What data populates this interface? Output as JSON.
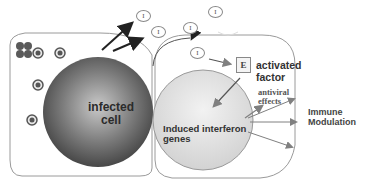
{
  "diagram": {
    "type": "biological-pathway",
    "left_cell": {
      "label_line1": "infected",
      "label_line2": "cell",
      "virus_particles_count": 4,
      "blocked_marker": "x-mark"
    },
    "right_cell": {
      "nucleus_label_line1": "Induced interferon",
      "nucleus_label_line2": "genes"
    },
    "interferon_symbol": "I",
    "interferon_molecules": [
      {
        "id": "i1",
        "x": 141,
        "y": 10
      },
      {
        "id": "i2",
        "x": 155,
        "y": 25
      },
      {
        "id": "i3",
        "x": 208,
        "y": 8
      },
      {
        "id": "i4",
        "x": 187,
        "y": 24
      },
      {
        "id": "i5",
        "x": 193,
        "y": 47
      }
    ],
    "effector": {
      "symbol": "E",
      "label_line1": "activated",
      "label_line2": "factor"
    },
    "outputs": {
      "antiviral_line1": "antiviral",
      "antiviral_line2": "effects",
      "immune_line1": "Immune",
      "immune_line2": "Modulation"
    },
    "caption_fragment": "",
    "colors": {
      "cell_outline": "#9a9a9a",
      "infected_nucleus_dark": "#3c3c3c",
      "infected_nucleus_light": "#bdbdbd",
      "induced_nucleus": "#dedede",
      "arrow_dark": "#222222",
      "arrow_gray": "#808080",
      "virus_ring": "#555555",
      "blocked_marker": "#5a5a5a"
    }
  }
}
